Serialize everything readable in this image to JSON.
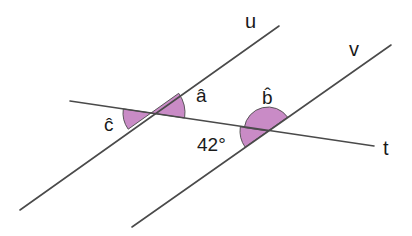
{
  "diagram": {
    "type": "parallel-lines-cut-by-transversal",
    "colors": {
      "background": "#ffffff",
      "line": "#4a4a4a",
      "angle_fill": "#c98bc6",
      "text": "#1a1a1a"
    },
    "lines": {
      "u": {
        "label": "u"
      },
      "v": {
        "label": "v"
      },
      "t": {
        "label": "t"
      }
    },
    "angles": {
      "a": {
        "label": "â"
      },
      "b": {
        "label": "b̂"
      },
      "c": {
        "label": "ĉ"
      },
      "given": {
        "label": "42°",
        "value_degrees": 42
      }
    }
  }
}
